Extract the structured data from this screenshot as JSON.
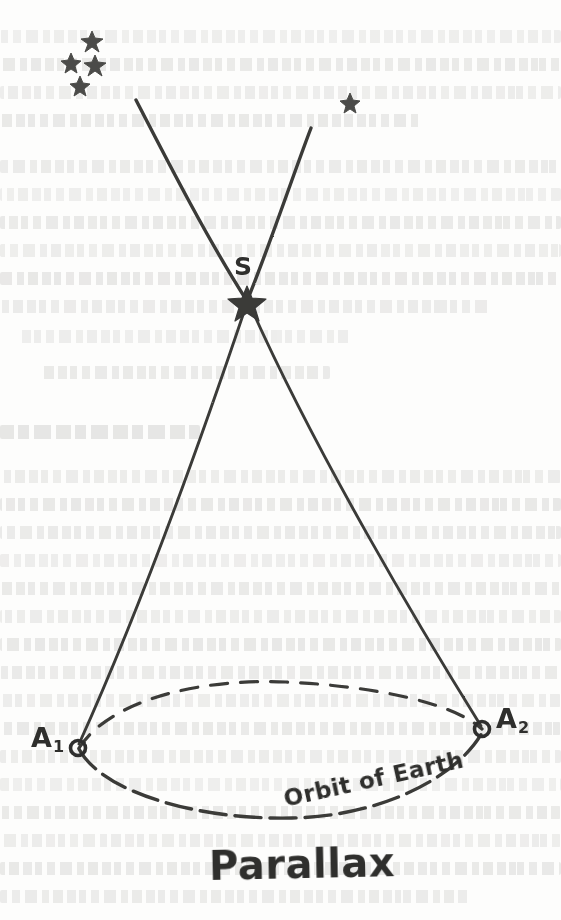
{
  "figure": {
    "title": "Parallax",
    "caption": "Parallax",
    "medium": "hand-drawn pencil sketch on printed book page"
  },
  "labels": {
    "star_label": "S",
    "earth_position_1": "A",
    "earth_position_1_sub": "1",
    "earth_position_2": "A",
    "earth_position_2_sub": "2",
    "orbit_label": "Orbit of Earth",
    "title_label": "Parallax"
  },
  "colors": {
    "paper": "#fdfdfc",
    "ink": "#3a3a38",
    "ink_dark": "#2f2f2d",
    "bleed_text": "#4a4a46"
  },
  "geometry": {
    "star_S": {
      "x": 247,
      "y": 301
    },
    "earth_A1": {
      "x": 78,
      "y": 748
    },
    "earth_A2": {
      "x": 482,
      "y": 729
    },
    "sight_line_left_top": {
      "x": 136,
      "y": 100
    },
    "sight_line_right_top": {
      "x": 311,
      "y": 128
    },
    "orbit_center": {
      "x": 280,
      "y": 755
    },
    "orbit_rx": 205,
    "orbit_ry": 52
  },
  "background_stars": [
    {
      "x": 92,
      "y": 38,
      "size": 15
    },
    {
      "x": 71,
      "y": 60,
      "size": 14
    },
    {
      "x": 95,
      "y": 62,
      "size": 15
    },
    {
      "x": 80,
      "y": 83,
      "size": 13
    },
    {
      "x": 350,
      "y": 100,
      "size": 13
    }
  ],
  "bleed_text_lines": [
    {
      "x": 0,
      "y": 30,
      "w": 561
    },
    {
      "x": 0,
      "y": 58,
      "w": 561
    },
    {
      "x": 0,
      "y": 86,
      "w": 561
    },
    {
      "x": 0,
      "y": 114,
      "w": 420
    },
    {
      "x": 0,
      "y": 160,
      "w": 561
    },
    {
      "x": 0,
      "y": 188,
      "w": 561
    },
    {
      "x": 0,
      "y": 216,
      "w": 561
    },
    {
      "x": 0,
      "y": 244,
      "w": 561
    },
    {
      "x": 0,
      "y": 272,
      "w": 561
    },
    {
      "x": 0,
      "y": 300,
      "w": 490
    },
    {
      "x": 20,
      "y": 330,
      "w": 330
    },
    {
      "x": 40,
      "y": 366,
      "w": 290
    },
    {
      "x": 0,
      "y": 470,
      "w": 561
    },
    {
      "x": 0,
      "y": 498,
      "w": 561
    },
    {
      "x": 0,
      "y": 526,
      "w": 561
    },
    {
      "x": 0,
      "y": 554,
      "w": 561
    },
    {
      "x": 0,
      "y": 582,
      "w": 561
    },
    {
      "x": 0,
      "y": 610,
      "w": 561
    },
    {
      "x": 0,
      "y": 638,
      "w": 561
    },
    {
      "x": 0,
      "y": 666,
      "w": 561
    },
    {
      "x": 0,
      "y": 694,
      "w": 561
    },
    {
      "x": 0,
      "y": 722,
      "w": 561
    },
    {
      "x": 0,
      "y": 750,
      "w": 561
    },
    {
      "x": 0,
      "y": 778,
      "w": 561
    },
    {
      "x": 0,
      "y": 806,
      "w": 561
    },
    {
      "x": 0,
      "y": 834,
      "w": 561
    },
    {
      "x": 0,
      "y": 862,
      "w": 561
    },
    {
      "x": 0,
      "y": 890,
      "w": 470
    }
  ],
  "bleed_headings": [
    {
      "x": 0,
      "y": 425,
      "w": 200
    }
  ]
}
